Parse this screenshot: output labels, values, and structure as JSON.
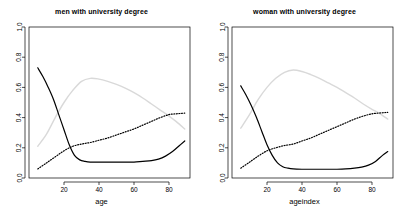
{
  "figure": {
    "background_color": "#ffffff",
    "panel_count": 2
  },
  "chart_data": [
    {
      "type": "line",
      "panel": "left",
      "title": "men with university degree",
      "xlabel": "age",
      "ylabel": "",
      "xlim": [
        0,
        92
      ],
      "ylim": [
        0.0,
        1.0
      ],
      "xticks": [
        20,
        40,
        60,
        80
      ],
      "yticks": [
        0.0,
        0.2,
        0.4,
        0.6,
        0.8,
        1.0
      ],
      "ytick_labels": [
        "0.0",
        "0.2",
        "0.4",
        "0.6",
        "0.8",
        "1.0"
      ],
      "xtick_labels": [
        "20",
        "40",
        "60",
        "80"
      ],
      "grid": false,
      "legend": "none",
      "series": [
        {
          "name": "solid-black-curve",
          "style": "solid",
          "color": "#000000",
          "width": 1.2,
          "x": [
            5,
            8,
            11,
            14,
            17,
            20,
            23,
            26,
            29,
            32,
            35,
            40,
            45,
            50,
            55,
            60,
            65,
            70,
            74,
            78,
            82,
            86,
            89
          ],
          "values": [
            0.73,
            0.67,
            0.6,
            0.52,
            0.42,
            0.32,
            0.22,
            0.15,
            0.12,
            0.11,
            0.105,
            0.105,
            0.105,
            0.105,
            0.105,
            0.105,
            0.11,
            0.115,
            0.125,
            0.145,
            0.175,
            0.215,
            0.245
          ]
        },
        {
          "name": "dotted-black-curve",
          "style": "dotted",
          "color": "#000000",
          "width": 1.2,
          "x": [
            5,
            10,
            15,
            20,
            25,
            30,
            35,
            40,
            45,
            50,
            55,
            60,
            65,
            70,
            75,
            80,
            84,
            89
          ],
          "values": [
            0.06,
            0.1,
            0.14,
            0.18,
            0.21,
            0.225,
            0.235,
            0.25,
            0.265,
            0.285,
            0.305,
            0.325,
            0.35,
            0.375,
            0.4,
            0.42,
            0.425,
            0.43
          ]
        },
        {
          "name": "light-gray-curve",
          "style": "solid",
          "color": "#d9d9d9",
          "width": 1.4,
          "x": [
            5,
            10,
            15,
            20,
            25,
            30,
            35,
            40,
            45,
            50,
            55,
            60,
            65,
            70,
            75,
            80,
            84,
            89
          ],
          "values": [
            0.21,
            0.29,
            0.4,
            0.5,
            0.58,
            0.64,
            0.66,
            0.655,
            0.64,
            0.62,
            0.595,
            0.565,
            0.53,
            0.49,
            0.45,
            0.41,
            0.375,
            0.325
          ]
        }
      ]
    },
    {
      "type": "line",
      "panel": "right",
      "title": "woman with university degree",
      "xlabel": "ageindex",
      "ylabel": "",
      "xlim": [
        0,
        92
      ],
      "ylim": [
        0.0,
        1.0
      ],
      "xticks": [
        20,
        40,
        60,
        80
      ],
      "yticks": [
        0.0,
        0.2,
        0.4,
        0.6,
        0.8,
        1.0
      ],
      "ytick_labels": [
        "0.0",
        "0.2",
        "0.4",
        "0.6",
        "0.8",
        "1.0"
      ],
      "xtick_labels": [
        "20",
        "40",
        "60",
        "80"
      ],
      "grid": false,
      "legend": "none",
      "series": [
        {
          "name": "solid-black-curve",
          "style": "solid",
          "color": "#000000",
          "width": 1.2,
          "x": [
            5,
            8,
            11,
            14,
            17,
            20,
            23,
            26,
            29,
            32,
            35,
            40,
            45,
            50,
            55,
            60,
            65,
            70,
            74,
            78,
            82,
            86,
            89
          ],
          "values": [
            0.61,
            0.55,
            0.48,
            0.4,
            0.31,
            0.22,
            0.15,
            0.1,
            0.075,
            0.065,
            0.06,
            0.058,
            0.058,
            0.058,
            0.058,
            0.058,
            0.06,
            0.065,
            0.072,
            0.085,
            0.11,
            0.15,
            0.175
          ]
        },
        {
          "name": "dotted-black-curve",
          "style": "dotted",
          "color": "#000000",
          "width": 1.2,
          "x": [
            5,
            10,
            15,
            20,
            25,
            30,
            35,
            40,
            45,
            50,
            55,
            60,
            65,
            70,
            75,
            80,
            84,
            89
          ],
          "values": [
            0.065,
            0.105,
            0.145,
            0.18,
            0.2,
            0.215,
            0.225,
            0.245,
            0.265,
            0.29,
            0.315,
            0.34,
            0.365,
            0.39,
            0.41,
            0.425,
            0.43,
            0.435
          ]
        },
        {
          "name": "light-gray-curve",
          "style": "solid",
          "color": "#d9d9d9",
          "width": 1.4,
          "x": [
            5,
            10,
            15,
            20,
            25,
            30,
            35,
            40,
            45,
            50,
            55,
            60,
            65,
            70,
            75,
            80,
            84,
            89
          ],
          "values": [
            0.33,
            0.42,
            0.52,
            0.6,
            0.66,
            0.7,
            0.715,
            0.705,
            0.685,
            0.66,
            0.63,
            0.6,
            0.565,
            0.53,
            0.49,
            0.455,
            0.43,
            0.39
          ]
        }
      ]
    }
  ]
}
